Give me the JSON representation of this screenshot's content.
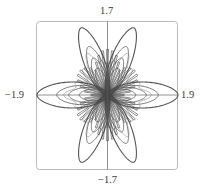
{
  "chart_data": {
    "type": "line",
    "subtype": "polar-curve",
    "title": "",
    "xlabel": "",
    "ylabel": "",
    "xlim": [
      -1.9,
      1.9
    ],
    "ylim": [
      -1.7,
      1.7
    ],
    "axis_labels": {
      "top": "1.7",
      "bottom": "−1.7",
      "left": "−1.9",
      "right": "1.9"
    },
    "grid": false,
    "axes_through_origin": true,
    "frame": {
      "rounded": true
    },
    "legend": null,
    "petals": [
      {
        "angle_deg": 0,
        "length": 1.9
      },
      {
        "angle_deg": 65,
        "length": 1.7
      },
      {
        "angle_deg": 115,
        "length": 1.7
      },
      {
        "angle_deg": 180,
        "length": 1.9
      },
      {
        "angle_deg": 245,
        "length": 1.7
      },
      {
        "angle_deg": 295,
        "length": 1.7
      }
    ],
    "nested_loop_scales": [
      1.0,
      0.72,
      0.55,
      0.4
    ],
    "colors": {
      "curve": "#555555",
      "axes": "#777777",
      "frame": "#bbbbbb"
    }
  }
}
